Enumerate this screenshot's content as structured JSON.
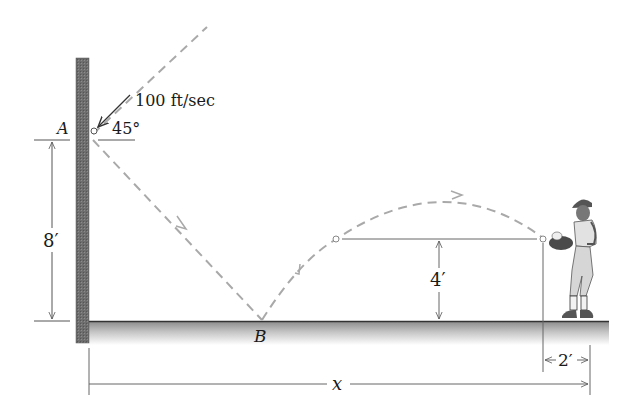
{
  "diagram": {
    "labels": {
      "point_a": "A",
      "point_b": "B",
      "velocity": "100 ft/sec",
      "angle": "45°",
      "height_a": "8′",
      "catch_height": "4′",
      "catch_offset": "2′",
      "distance": "x"
    },
    "colors": {
      "wall": "#6e6e6e",
      "ground_top": "#8a8a8a",
      "ground_fade": "#ffffff",
      "trajectory": "#a9a9a9",
      "dimension": "#555555",
      "text": "#1a1a1a"
    }
  }
}
